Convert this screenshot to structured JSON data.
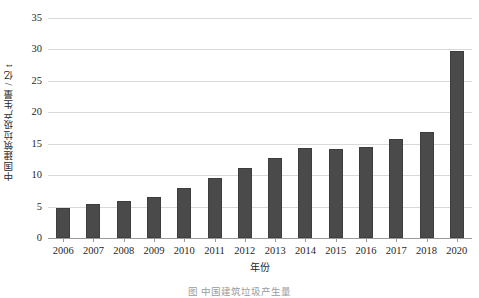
{
  "chart_data": {
    "type": "bar",
    "title": "",
    "xlabel": "年份",
    "ylabel": "中国建筑垃圾产生量 / 亿 t",
    "categories": [
      "2006",
      "2007",
      "2008",
      "2009",
      "2010",
      "2011",
      "2012",
      "2013",
      "2014",
      "2015",
      "2016",
      "2017",
      "2018",
      "2020"
    ],
    "values": [
      4.7,
      5.4,
      5.9,
      6.6,
      8.0,
      9.6,
      11.2,
      12.8,
      14.3,
      14.1,
      14.5,
      15.8,
      16.8,
      29.8
    ],
    "series": [
      {
        "name": "中国建筑垃圾产生量",
        "values": [
          4.7,
          5.4,
          5.9,
          6.6,
          8.0,
          9.6,
          11.2,
          12.8,
          14.3,
          14.1,
          14.5,
          15.8,
          16.8,
          29.8
        ]
      }
    ],
    "ylim": [
      0,
      35
    ],
    "yticks": [
      0,
      5,
      10,
      15,
      20,
      25,
      30,
      35
    ],
    "ytick_labels": [
      "0",
      "5",
      "10",
      "15",
      "20",
      "25",
      "30",
      "35"
    ],
    "grid": true,
    "grid_axis": "y",
    "legend": false,
    "legend_position": "none",
    "bar_color": "#4a4a4a",
    "grid_color": "#d9d9d9",
    "axis_color": "#9a9a9a",
    "background": "#ffffff"
  },
  "caption": "图     中国建筑垃圾产生量"
}
